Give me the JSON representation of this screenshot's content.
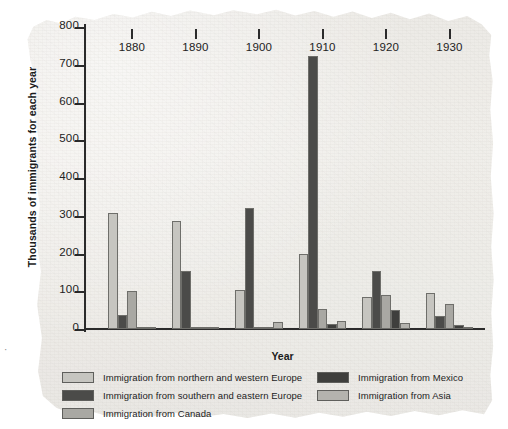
{
  "chart_data": {
    "type": "bar",
    "title": "",
    "xlabel": "Year",
    "ylabel": "Thousands of immigrants for each year",
    "categories": [
      "1880",
      "1890",
      "1900",
      "1910",
      "1920",
      "1930"
    ],
    "ylim": [
      0,
      800
    ],
    "yticks": [
      0,
      100,
      200,
      300,
      400,
      500,
      600,
      700,
      800
    ],
    "grid": false,
    "legend_position": "bottom",
    "series": [
      {
        "name": "Immigration from northern and western Europe",
        "color": "#c6c5c0",
        "values": [
          307,
          285,
          103,
          200,
          85,
          95
        ]
      },
      {
        "name": "Immigration from southern and eastern Europe",
        "color": "#4b4b49",
        "values": [
          38,
          155,
          320,
          723,
          155,
          35
        ]
      },
      {
        "name": "Immigration from Canada",
        "color": "#a9a8a3",
        "values": [
          100,
          2,
          3,
          52,
          90,
          65
        ]
      },
      {
        "name": "Immigration from Mexico",
        "color": "#3f3f3d",
        "values": [
          5,
          1,
          1,
          12,
          50,
          10
        ]
      },
      {
        "name": "Immigration from Asia",
        "color": "#b4b3ae",
        "values": [
          1,
          4,
          18,
          22,
          17,
          3
        ]
      }
    ]
  },
  "axis": {
    "y_title": "Thousands of immigrants for each year",
    "x_title": "Year",
    "y_tick_labels": [
      "800",
      "700",
      "600",
      "500",
      "400",
      "300",
      "200",
      "100",
      "0"
    ],
    "x_tick_labels": [
      "1880",
      "1890",
      "1900",
      "1910",
      "1920",
      "1930"
    ]
  },
  "legend": {
    "left_column": [
      {
        "label": "Immigration from northern and western Europe",
        "color": "#c6c5c0"
      },
      {
        "label": "Immigration from southern and eastern Europe",
        "color": "#4b4b49"
      },
      {
        "label": "Immigration from Canada",
        "color": "#a9a8a3"
      }
    ],
    "right_column": [
      {
        "label": "Immigration from Mexico",
        "color": "#3f3f3d"
      },
      {
        "label": "Immigration from Asia",
        "color": "#b4b3ae"
      }
    ]
  },
  "page": {
    "stray_mark": "·"
  }
}
